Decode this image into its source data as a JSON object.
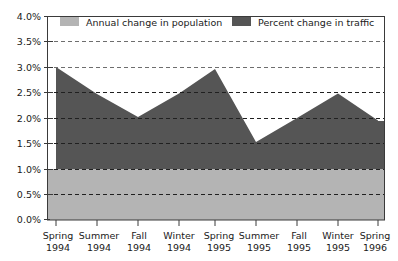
{
  "chart_data": {
    "type": "area",
    "title": "",
    "subtitle": "",
    "xlabel": "",
    "ylabel": "",
    "ylim": [
      0.0,
      4.0
    ],
    "ytick_labels": [
      "4.0%",
      "3.5%",
      "3.0%",
      "2.5%",
      "2.0%",
      "1.5%",
      "1.0%",
      "0.5%",
      "0.0%"
    ],
    "ytick_values": [
      4.0,
      3.5,
      3.0,
      2.5,
      2.0,
      1.5,
      1.0,
      0.5,
      0.0
    ],
    "grid": true,
    "grid_style": "dashed-horizontal",
    "stacked": false,
    "legend_position": "top-inside",
    "categories": [
      "Spring 1994",
      "Summer 1994",
      "Fall 1994",
      "Winter 1994",
      "Spring 1995",
      "Summer 1995",
      "Fall 1995",
      "Winter 1995",
      "Spring 1996"
    ],
    "xtick_labels_line1": [
      "Spring",
      "Summer",
      "Fall",
      "Winter",
      "Spring",
      "Summer",
      "Fall",
      "Winter",
      "Spring"
    ],
    "xtick_labels_line2": [
      "1994",
      "1994",
      "1994",
      "1994",
      "1995",
      "1995",
      "1995",
      "1995",
      "1996"
    ],
    "series": [
      {
        "name": "Percent change in traffic",
        "color": "#555555",
        "values": [
          3.0,
          2.47,
          2.02,
          2.48,
          2.96,
          1.53,
          2.0,
          2.48,
          1.95
        ]
      },
      {
        "name": "Annual change in population",
        "color": "#b4b4b4",
        "values": [
          1.0,
          1.0,
          1.0,
          1.0,
          1.0,
          1.0,
          1.0,
          1.0,
          1.0
        ]
      }
    ]
  },
  "legend": {
    "items": [
      {
        "label": "Annual change in population",
        "color": "#b4b4b4"
      },
      {
        "label": "Percent change in traffic",
        "color": "#555555"
      }
    ]
  },
  "yaxis": {
    "t0": "4.0%",
    "t1": "3.5%",
    "t2": "3.0%",
    "t3": "2.5%",
    "t4": "2.0%",
    "t5": "1.5%",
    "t6": "1.0%",
    "t7": "0.5%",
    "t8": "0.0%"
  },
  "xaxis": {
    "s0a": "Spring",
    "s0b": "1994",
    "s1a": "Summer",
    "s1b": "1994",
    "s2a": "Fall",
    "s2b": "1994",
    "s3a": "Winter",
    "s3b": "1994",
    "s4a": "Spring",
    "s4b": "1995",
    "s5a": "Summer",
    "s5b": "1995",
    "s6a": "Fall",
    "s6b": "1995",
    "s7a": "Winter",
    "s7b": "1995",
    "s8a": "Spring",
    "s8b": "1996"
  }
}
